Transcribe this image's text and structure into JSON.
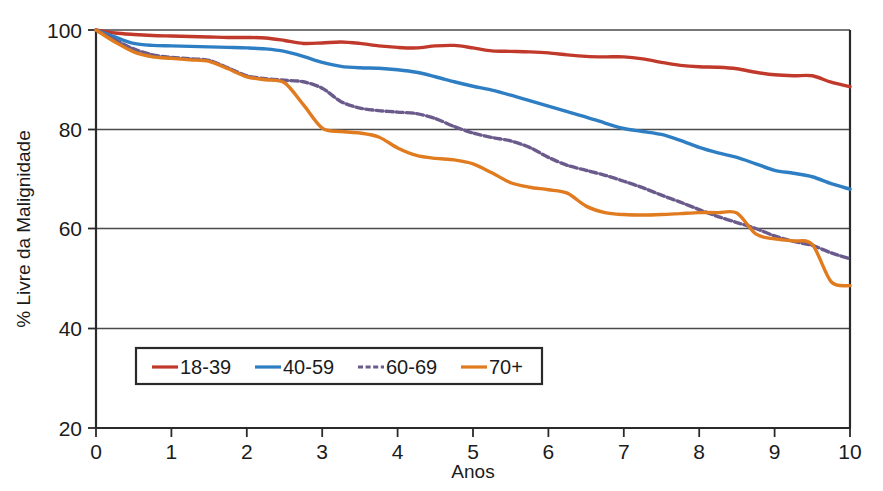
{
  "chart_data": {
    "type": "line",
    "title": "",
    "subtitle": "",
    "xlabel": "Anos",
    "ylabel": "% Livre da Malignidade",
    "xlim": [
      0,
      10
    ],
    "ylim": [
      20,
      100
    ],
    "xticks": [
      "0",
      "1",
      "2",
      "3",
      "4",
      "5",
      "6",
      "7",
      "8",
      "9",
      "10"
    ],
    "yticks": [
      "20",
      "40",
      "60",
      "80",
      "100"
    ],
    "grid": "horizontal-gridlines-at-40-60-80",
    "legend_position": "inside-bottom-left",
    "x": [
      0,
      0.25,
      0.5,
      0.75,
      1,
      1.25,
      1.5,
      1.75,
      2,
      2.25,
      2.5,
      2.75,
      3,
      3.25,
      3.5,
      3.75,
      4,
      4.25,
      4.5,
      4.75,
      5,
      5.25,
      5.5,
      5.75,
      6,
      6.25,
      6.5,
      6.75,
      7,
      7.25,
      7.5,
      7.75,
      8,
      8.25,
      8.5,
      8.75,
      9,
      9.25,
      9.5,
      9.75,
      10
    ],
    "series": [
      {
        "name": "18-39",
        "color": "#c0392b",
        "dash": "solid",
        "values": [
          100,
          99.4,
          99.1,
          98.9,
          98.8,
          98.7,
          98.6,
          98.5,
          98.5,
          98.4,
          97.9,
          97.3,
          97.4,
          97.6,
          97.3,
          96.8,
          96.5,
          96.4,
          96.8,
          96.9,
          96.4,
          95.8,
          95.7,
          95.6,
          95.4,
          95.0,
          94.7,
          94.6,
          94.6,
          94.2,
          93.5,
          92.9,
          92.6,
          92.5,
          92.2,
          91.5,
          91.0,
          90.8,
          90.8,
          89.5,
          88.6
        ]
      },
      {
        "name": "40-59",
        "color": "#2e7ec4",
        "dash": "solid",
        "values": [
          100,
          98.6,
          97.3,
          96.9,
          96.8,
          96.7,
          96.6,
          96.5,
          96.4,
          96.2,
          95.7,
          94.7,
          93.5,
          92.7,
          92.4,
          92.3,
          92.0,
          91.5,
          90.6,
          89.6,
          88.7,
          87.9,
          86.9,
          85.8,
          84.7,
          83.6,
          82.5,
          81.3,
          80.2,
          79.6,
          79.0,
          77.8,
          76.4,
          75.3,
          74.4,
          73.1,
          71.8,
          71.2,
          70.5,
          69.1,
          68.0
        ]
      },
      {
        "name": "60-69",
        "color": "#6b5b8c",
        "dash": "dashed",
        "values": [
          100,
          98.0,
          96.2,
          95.0,
          94.5,
          94.2,
          93.9,
          92.4,
          90.8,
          90.2,
          89.9,
          89.6,
          88.3,
          85.6,
          84.3,
          83.8,
          83.5,
          83.2,
          82.2,
          80.6,
          79.3,
          78.4,
          77.7,
          76.4,
          74.4,
          72.8,
          71.8,
          70.8,
          69.6,
          68.3,
          66.8,
          65.4,
          63.9,
          62.5,
          61.3,
          60.1,
          58.6,
          57.5,
          56.7,
          55.2,
          54.0
        ]
      },
      {
        "name": "70+",
        "color": "#e07b1f",
        "dash": "solid",
        "values": [
          100,
          97.6,
          95.6,
          94.6,
          94.3,
          94.0,
          93.7,
          92.2,
          90.6,
          90.0,
          89.4,
          85.0,
          80.3,
          79.6,
          79.3,
          78.5,
          76.3,
          74.8,
          74.2,
          73.9,
          73.1,
          71.3,
          69.3,
          68.4,
          67.9,
          67.2,
          64.6,
          63.3,
          62.9,
          62.8,
          62.9,
          63.1,
          63.3,
          63.3,
          63.2,
          59.0,
          58.0,
          57.6,
          56.9,
          49.4,
          48.6
        ]
      }
    ]
  },
  "legend": {
    "entries": [
      {
        "label": "18-39",
        "color": "#c0392b",
        "style": "solid"
      },
      {
        "label": "40-59",
        "color": "#2e7ec4",
        "style": "solid"
      },
      {
        "label": "60-69",
        "color": "#6b5b8c",
        "style": "dashed"
      },
      {
        "label": "70+",
        "color": "#e07b1f",
        "style": "solid"
      }
    ]
  },
  "axes": {
    "y_title": "% Livre da Malignidade",
    "x_title": "Anos",
    "y_tick_labels": [
      "100",
      "80",
      "60",
      "40",
      "20"
    ],
    "x_tick_labels": [
      "0",
      "1",
      "2",
      "3",
      "4",
      "5",
      "6",
      "7",
      "8",
      "9",
      "10"
    ]
  }
}
